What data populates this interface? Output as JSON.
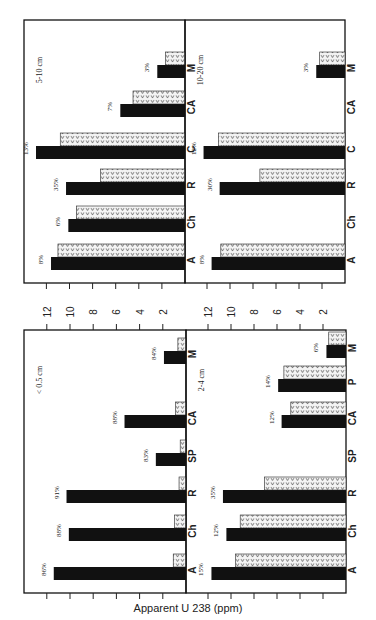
{
  "chart_data": {
    "type": "bar",
    "orientation_note": "figure printed rotated 90 degrees; bars grow from category axis (right edge) toward value axis labels",
    "value_axis_label": "Apparent U 238 (ppm)",
    "value_ticks": [
      2,
      4,
      6,
      8,
      10,
      12
    ],
    "value_range": [
      0,
      13
    ],
    "series_legend": [
      {
        "name": "solid",
        "style": "solid black"
      },
      {
        "name": "hatched",
        "style": "dotted with v pattern"
      }
    ],
    "panels": [
      {
        "id": "p-5-10",
        "title": "5-10 cm",
        "categories": [
          "A",
          "Ch",
          "R",
          "C",
          "CA",
          "M"
        ],
        "solid": [
          11.6,
          10.1,
          10.3,
          12.9,
          5.6,
          2.4
        ],
        "hatched": [
          11.0,
          9.4,
          7.3,
          10.8,
          4.5,
          1.7
        ],
        "pct_labels": [
          "8%",
          "6%",
          "35%",
          "13%",
          "7%",
          "3%"
        ]
      },
      {
        "id": "p-10-20",
        "title": "10-20 cm",
        "categories": [
          "A",
          "Ch",
          "R",
          "C",
          "CA",
          "M"
        ],
        "solid": [
          11.6,
          null,
          10.9,
          12.3,
          null,
          2.5
        ],
        "hatched": [
          10.8,
          null,
          7.4,
          11.0,
          null,
          2.2
        ],
        "pct_labels": [
          "8%",
          "",
          "30%",
          "12%",
          "",
          "3%"
        ]
      },
      {
        "id": "p-lt-0-5",
        "title": "< 0.5 cm",
        "categories": [
          "A",
          "Ch",
          "R",
          "SP",
          "CA",
          "M"
        ],
        "solid": [
          11.4,
          10.1,
          10.3,
          2.6,
          5.3,
          1.9
        ],
        "hatched": [
          1.1,
          1.0,
          0.6,
          0.5,
          0.9,
          0.7
        ],
        "pct_labels": [
          "86%",
          "88%",
          "91%",
          "83%",
          "88%",
          "84%"
        ]
      },
      {
        "id": "p-2-4",
        "title": "2-4 cm",
        "categories": [
          "A",
          "Ch",
          "R",
          "SP",
          "CA",
          "P",
          "M"
        ],
        "solid": [
          11.7,
          10.4,
          10.7,
          null,
          5.6,
          5.9,
          1.7
        ],
        "hatched": [
          9.6,
          9.2,
          7.1,
          null,
          4.8,
          5.4,
          1.5
        ],
        "pct_labels": [
          "15%",
          "12%",
          "35%",
          "",
          "12%",
          "14%",
          "6%"
        ]
      }
    ]
  },
  "layout": {
    "panels": [
      {
        "ref": 0,
        "baseline_x": 185,
        "unit_px": 11.55,
        "top_y": 20,
        "bottom_y": 283,
        "left_x": 24
      },
      {
        "ref": 1,
        "baseline_x": 345,
        "unit_px": 11.5,
        "top_y": 20,
        "bottom_y": 283,
        "left_x": 185
      },
      {
        "ref": 2,
        "baseline_x": 186,
        "unit_px": 11.6,
        "top_y": 330,
        "bottom_y": 593,
        "left_x": 24
      },
      {
        "ref": 3,
        "baseline_x": 346,
        "unit_px": 11.5,
        "top_y": 330,
        "bottom_y": 593,
        "left_x": 186
      }
    ],
    "category_y": {
      "p-5-10": [
        270,
        232,
        195,
        159,
        117,
        78
      ],
      "p-10-20": [
        270,
        232,
        195,
        159,
        117,
        78
      ],
      "p-lt-0-5": [
        580,
        541,
        503,
        466,
        428,
        364
      ],
      "p-2-4": [
        580,
        541,
        503,
        466,
        428,
        392,
        358
      ]
    },
    "colors": {
      "solid": "#111111",
      "hatched_bg": "#f2f2f2",
      "hatched_mark": "#333333",
      "frame": "#111111"
    }
  }
}
